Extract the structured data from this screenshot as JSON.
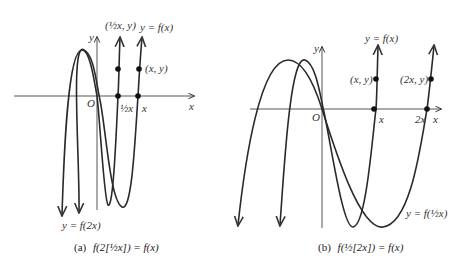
{
  "panel_a": {
    "y_axis_label": "y",
    "x_axis_label": "x",
    "origin_label": "O",
    "point_half_label": "(½x, y)",
    "point_label": "(x, y)",
    "curve_f_label": "y = f(x)",
    "curve_f2x_label": "y = f(2x)",
    "tick_half_x": "½x",
    "tick_x": "x",
    "caption_prefix": "(a)",
    "caption": "f(2[½x]) = f(x)"
  },
  "panel_b": {
    "y_axis_label": "y",
    "x_axis_label": "x",
    "origin_label": "O",
    "point_label": "(x, y)",
    "point_2x_label": "(2x, y)",
    "curve_f_label": "y = f(x)",
    "curve_fhalf_label": "y = f(½x)",
    "tick_x": "x",
    "tick_2x": "2x",
    "caption_prefix": "(b)",
    "caption": "f(½[2x]) = f(x)"
  },
  "colors": {
    "curve": "#2a2a2a",
    "axis": "#555555",
    "text": "#333333"
  }
}
